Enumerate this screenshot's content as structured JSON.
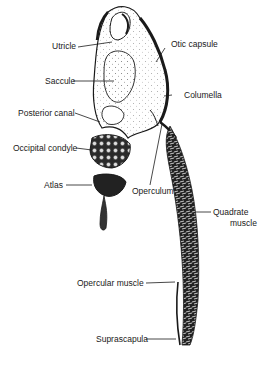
{
  "figure": {
    "type": "anatomical line drawing",
    "colors": {
      "ink": "#1a1a1a",
      "background": "#ffffff",
      "stipple": "#555555"
    },
    "labels": [
      {
        "id": "utricle",
        "text": "Utricle"
      },
      {
        "id": "saccule",
        "text": "Saccule"
      },
      {
        "id": "posterior-canal",
        "text": "Posterior canal"
      },
      {
        "id": "occipital-condyle",
        "text": "Occipital condyle"
      },
      {
        "id": "atlas",
        "text": "Atlas"
      },
      {
        "id": "otic-capsule",
        "text": "Otic capsule"
      },
      {
        "id": "columella",
        "text": "Columella"
      },
      {
        "id": "operculum",
        "text": "Operculum"
      },
      {
        "id": "quadrate-muscle-1",
        "text": "Quadrate"
      },
      {
        "id": "quadrate-muscle-2",
        "text": "muscle"
      },
      {
        "id": "opercular-muscle",
        "text": "Opercular muscle"
      },
      {
        "id": "suprascapula",
        "text": "Suprascapula"
      }
    ]
  }
}
